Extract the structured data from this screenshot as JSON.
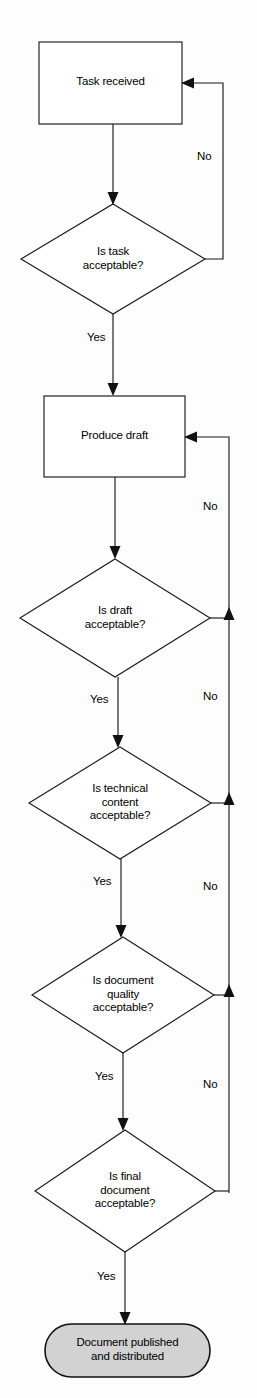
{
  "diagram": {
    "type": "flowchart",
    "colors": {
      "background": "#fdfdfd",
      "stroke": "#1a1a1a",
      "process_fill": "#ffffff",
      "decision_fill": "#ffffff",
      "terminal_fill": "#d2d2d2"
    },
    "nodes": {
      "task_received": {
        "shape": "process",
        "label": "Task received"
      },
      "is_task_acceptable": {
        "shape": "decision",
        "label": "Is task\nacceptable?"
      },
      "produce_draft": {
        "shape": "process",
        "label": "Produce draft"
      },
      "is_draft_acceptable": {
        "shape": "decision",
        "label": "Is draft\nacceptable?"
      },
      "is_technical_content_acceptable": {
        "shape": "decision",
        "label": "Is technical\ncontent\nacceptable?"
      },
      "is_document_quality_acceptable": {
        "shape": "decision",
        "label": "Is document\nquality\nacceptable?"
      },
      "is_final_document_acceptable": {
        "shape": "decision",
        "label": "Is final\ndocument\nacceptable?"
      },
      "document_published": {
        "shape": "terminal",
        "label": "Document published\nand distributed"
      }
    },
    "edge_labels": {
      "task_no": "No",
      "task_yes": "Yes",
      "draft_no": "No",
      "draft_yes": "Yes",
      "technical_no": "No",
      "technical_yes": "Yes",
      "quality_no": "No",
      "quality_yes": "Yes",
      "final_no": "No",
      "final_yes": "Yes"
    },
    "edges": [
      {
        "from": "task_received",
        "to": "is_task_acceptable",
        "label": ""
      },
      {
        "from": "is_task_acceptable",
        "to": "task_received",
        "label": "No"
      },
      {
        "from": "is_task_acceptable",
        "to": "produce_draft",
        "label": "Yes"
      },
      {
        "from": "produce_draft",
        "to": "is_draft_acceptable",
        "label": ""
      },
      {
        "from": "is_draft_acceptable",
        "to": "produce_draft",
        "label": "No"
      },
      {
        "from": "is_draft_acceptable",
        "to": "is_technical_content_acceptable",
        "label": "Yes"
      },
      {
        "from": "is_technical_content_acceptable",
        "to": "produce_draft",
        "label": "No"
      },
      {
        "from": "is_technical_content_acceptable",
        "to": "is_document_quality_acceptable",
        "label": "Yes"
      },
      {
        "from": "is_document_quality_acceptable",
        "to": "produce_draft",
        "label": "No"
      },
      {
        "from": "is_document_quality_acceptable",
        "to": "is_final_document_acceptable",
        "label": "Yes"
      },
      {
        "from": "is_final_document_acceptable",
        "to": "produce_draft",
        "label": "No"
      },
      {
        "from": "is_final_document_acceptable",
        "to": "document_published",
        "label": "Yes"
      }
    ]
  }
}
